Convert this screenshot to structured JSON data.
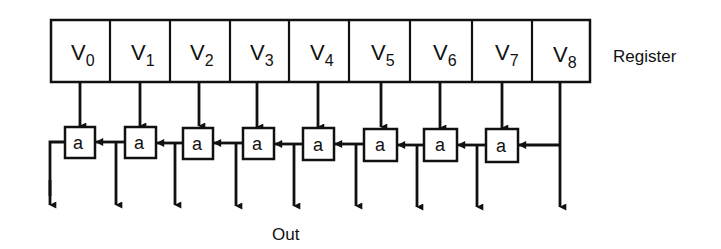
{
  "diagram": {
    "register_label": "Register",
    "output_label": "Out",
    "register_cells": [
      {
        "base": "V",
        "sub": "0"
      },
      {
        "base": "V",
        "sub": "1"
      },
      {
        "base": "V",
        "sub": "2"
      },
      {
        "base": "V",
        "sub": "3"
      },
      {
        "base": "V",
        "sub": "4"
      },
      {
        "base": "V",
        "sub": "5"
      },
      {
        "base": "V",
        "sub": "6"
      },
      {
        "base": "V",
        "sub": "7"
      },
      {
        "base": "V",
        "sub": "8"
      }
    ],
    "adders": [
      {
        "label": "a"
      },
      {
        "label": "a"
      },
      {
        "label": "a"
      },
      {
        "label": "a"
      },
      {
        "label": "a"
      },
      {
        "label": "a"
      },
      {
        "label": "a"
      },
      {
        "label": "a"
      }
    ],
    "line_color": "#111111",
    "background": "#ffffff"
  }
}
